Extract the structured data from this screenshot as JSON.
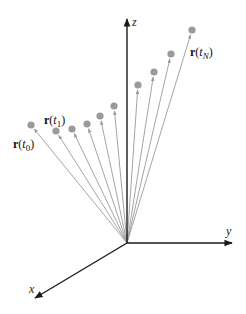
{
  "figure": {
    "width": 246,
    "height": 314,
    "background": "#ffffff",
    "origin": [
      127,
      243
    ],
    "axes": [
      {
        "name": "z",
        "label": "z",
        "tip": [
          127,
          19
        ],
        "label_pos": [
          132,
          26
        ]
      },
      {
        "name": "y",
        "label": "y",
        "tip": [
          232,
          243
        ],
        "label_pos": [
          226,
          235
        ]
      },
      {
        "name": "x",
        "label": "x",
        "tip": [
          35,
          298
        ],
        "label_pos": [
          29,
          293
        ]
      }
    ],
    "axis_color": "#1a1a1a",
    "vector_color": "#9a9a9a",
    "vectors": [
      {
        "id": "t0",
        "tip": [
          31,
          125
        ]
      },
      {
        "id": "t1",
        "tip": [
          56,
          131
        ]
      },
      {
        "id": "t2",
        "tip": [
          72,
          129
        ]
      },
      {
        "id": "t3",
        "tip": [
          87,
          124
        ]
      },
      {
        "id": "t4",
        "tip": [
          100,
          116
        ]
      },
      {
        "id": "t5",
        "tip": [
          114,
          106
        ]
      },
      {
        "id": "t6",
        "tip": [
          138,
          85
        ]
      },
      {
        "id": "t7",
        "tip": [
          154,
          72
        ]
      },
      {
        "id": "t8",
        "tip": [
          171,
          54
        ]
      },
      {
        "id": "t9",
        "tip": [
          192,
          30
        ]
      }
    ],
    "labels": [
      {
        "id": "r-t0",
        "bold": "r",
        "open": "(",
        "var": "t",
        "sub": "0",
        "close": ")",
        "pos": [
          13,
          148
        ]
      },
      {
        "id": "r-t1",
        "bold": "r",
        "open": "(",
        "var": "t",
        "sub": "1",
        "close": ")",
        "pos": [
          44,
          124
        ]
      },
      {
        "id": "r-tN",
        "bold": "r",
        "open": "(",
        "var": "t",
        "sub": "N",
        "close": ")",
        "pos": [
          190,
          56
        ]
      }
    ]
  }
}
